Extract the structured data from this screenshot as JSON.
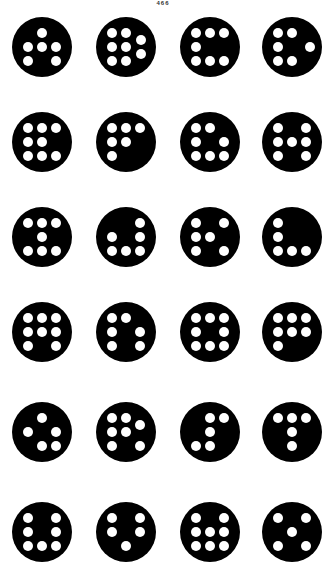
{
  "page": {
    "number": "466",
    "colors": {
      "disc": "#000000",
      "dot": "#ffffff",
      "background": "#ffffff"
    }
  },
  "figure": {
    "layout": {
      "columns_x": [
        42,
        126,
        210,
        292
      ],
      "rows_y": [
        47,
        142,
        237,
        332,
        432,
        532
      ],
      "disc_radius": 30,
      "dot_radius": 5.2,
      "grid_spacing": 14
    },
    "discs": [
      {
        "row": 0,
        "col": 0,
        "dots": [
          [
            0,
            -1
          ],
          [
            -1,
            0
          ],
          [
            0,
            0
          ],
          [
            1,
            0
          ],
          [
            -1,
            1
          ],
          [
            1,
            1
          ]
        ]
      },
      {
        "row": 0,
        "col": 1,
        "dots": [
          [
            -1,
            -1
          ],
          [
            0,
            -1
          ],
          [
            -1,
            0
          ],
          [
            0,
            0
          ],
          [
            -1,
            1
          ],
          [
            0,
            1
          ],
          [
            1.05,
            -0.5
          ],
          [
            1.05,
            0.5
          ]
        ]
      },
      {
        "row": 0,
        "col": 2,
        "dots": [
          [
            -1,
            -1
          ],
          [
            0,
            -1
          ],
          [
            1,
            -1
          ],
          [
            -1,
            0
          ],
          [
            -1,
            1
          ],
          [
            0,
            1
          ],
          [
            1,
            1
          ]
        ]
      },
      {
        "row": 0,
        "col": 3,
        "dots": [
          [
            -1,
            -1
          ],
          [
            0,
            -1
          ],
          [
            -1,
            0
          ],
          [
            -1,
            1
          ],
          [
            0,
            1
          ],
          [
            1.3,
            0
          ]
        ]
      },
      {
        "row": 1,
        "col": 0,
        "dots": [
          [
            -1,
            -1
          ],
          [
            0,
            -1
          ],
          [
            1,
            -1
          ],
          [
            -1,
            0
          ],
          [
            0,
            0
          ],
          [
            -1,
            1
          ],
          [
            0,
            1
          ],
          [
            1,
            1
          ]
        ]
      },
      {
        "row": 1,
        "col": 1,
        "dots": [
          [
            -1,
            -1
          ],
          [
            0,
            -1
          ],
          [
            1,
            -1
          ],
          [
            -1,
            0
          ],
          [
            0,
            0
          ],
          [
            -1,
            1
          ]
        ]
      },
      {
        "row": 1,
        "col": 2,
        "dots": [
          [
            -1,
            -1
          ],
          [
            0,
            -1
          ],
          [
            -1,
            0
          ],
          [
            1,
            0
          ],
          [
            -1,
            1
          ],
          [
            0,
            1
          ],
          [
            1,
            1
          ]
        ]
      },
      {
        "row": 1,
        "col": 3,
        "dots": [
          [
            -1,
            -1
          ],
          [
            1,
            -1
          ],
          [
            -1,
            0
          ],
          [
            0,
            0
          ],
          [
            1,
            0
          ],
          [
            -1,
            1
          ],
          [
            1,
            1
          ]
        ]
      },
      {
        "row": 2,
        "col": 0,
        "dots": [
          [
            -1,
            -1
          ],
          [
            0,
            -1
          ],
          [
            1,
            -1
          ],
          [
            0,
            0
          ],
          [
            -1,
            1
          ],
          [
            0,
            1
          ],
          [
            1,
            1
          ]
        ]
      },
      {
        "row": 2,
        "col": 1,
        "dots": [
          [
            1,
            -1
          ],
          [
            -1,
            0
          ],
          [
            1,
            0
          ],
          [
            -1,
            1
          ],
          [
            0,
            1
          ],
          [
            1,
            1
          ]
        ]
      },
      {
        "row": 2,
        "col": 2,
        "dots": [
          [
            -1,
            -1
          ],
          [
            1,
            -1
          ],
          [
            -1,
            0
          ],
          [
            0,
            0
          ],
          [
            -1,
            1
          ],
          [
            1,
            1
          ]
        ]
      },
      {
        "row": 2,
        "col": 3,
        "dots": [
          [
            -1,
            -1
          ],
          [
            -1,
            0
          ],
          [
            -1,
            1
          ],
          [
            0,
            1
          ],
          [
            1,
            1
          ]
        ]
      },
      {
        "row": 3,
        "col": 0,
        "dots": [
          [
            -1,
            -1
          ],
          [
            0,
            -1
          ],
          [
            1,
            -1
          ],
          [
            -1,
            0
          ],
          [
            0,
            0
          ],
          [
            1,
            0
          ],
          [
            -1,
            1
          ],
          [
            1,
            1
          ]
        ]
      },
      {
        "row": 3,
        "col": 1,
        "dots": [
          [
            -1,
            -1
          ],
          [
            0,
            -1
          ],
          [
            -1,
            0
          ],
          [
            1,
            0
          ],
          [
            -1,
            1
          ],
          [
            1,
            1
          ]
        ]
      },
      {
        "row": 3,
        "col": 2,
        "dots": [
          [
            -1,
            -1
          ],
          [
            0,
            -1
          ],
          [
            1,
            -1
          ],
          [
            -1,
            0
          ],
          [
            1,
            0
          ],
          [
            -1,
            1
          ],
          [
            0,
            1
          ],
          [
            1,
            1
          ]
        ]
      },
      {
        "row": 3,
        "col": 3,
        "dots": [
          [
            -1,
            -1
          ],
          [
            0,
            -1
          ],
          [
            1,
            -1
          ],
          [
            -1,
            0
          ],
          [
            0,
            0
          ],
          [
            1,
            0
          ],
          [
            -1,
            1
          ]
        ]
      },
      {
        "row": 4,
        "col": 0,
        "dots": [
          [
            0,
            -1
          ],
          [
            -1,
            0
          ],
          [
            1,
            0
          ],
          [
            0,
            1
          ],
          [
            1,
            1
          ]
        ]
      },
      {
        "row": 4,
        "col": 1,
        "dots": [
          [
            -1,
            -1
          ],
          [
            0,
            -1
          ],
          [
            -1,
            0
          ],
          [
            0,
            0
          ],
          [
            -1,
            1
          ],
          [
            1,
            1
          ],
          [
            1,
            -0.5
          ]
        ]
      },
      {
        "row": 4,
        "col": 2,
        "dots": [
          [
            0,
            -1
          ],
          [
            1,
            -1
          ],
          [
            0,
            0
          ],
          [
            -1,
            1
          ],
          [
            0,
            1
          ]
        ]
      },
      {
        "row": 4,
        "col": 3,
        "dots": [
          [
            -1,
            -1
          ],
          [
            0,
            -1
          ],
          [
            1,
            -1
          ],
          [
            0,
            0
          ],
          [
            0,
            1
          ]
        ]
      },
      {
        "row": 5,
        "col": 0,
        "dots": [
          [
            -1,
            -1
          ],
          [
            1,
            -1
          ],
          [
            -1,
            0
          ],
          [
            1,
            0
          ],
          [
            -1,
            1
          ],
          [
            0,
            1
          ],
          [
            1,
            1
          ]
        ]
      },
      {
        "row": 5,
        "col": 1,
        "dots": [
          [
            -1,
            -1
          ],
          [
            1,
            -1
          ],
          [
            -1,
            0
          ],
          [
            1,
            0
          ],
          [
            0,
            1
          ]
        ]
      },
      {
        "row": 5,
        "col": 2,
        "dots": [
          [
            -1,
            -1
          ],
          [
            1,
            -1
          ],
          [
            -1,
            0
          ],
          [
            0,
            0
          ],
          [
            1,
            0
          ],
          [
            -1,
            1
          ],
          [
            0,
            1
          ],
          [
            1,
            1
          ]
        ]
      },
      {
        "row": 5,
        "col": 3,
        "dots": [
          [
            -1,
            -1
          ],
          [
            1,
            -1
          ],
          [
            0,
            0
          ],
          [
            -1,
            1
          ],
          [
            1,
            1
          ]
        ]
      }
    ]
  }
}
